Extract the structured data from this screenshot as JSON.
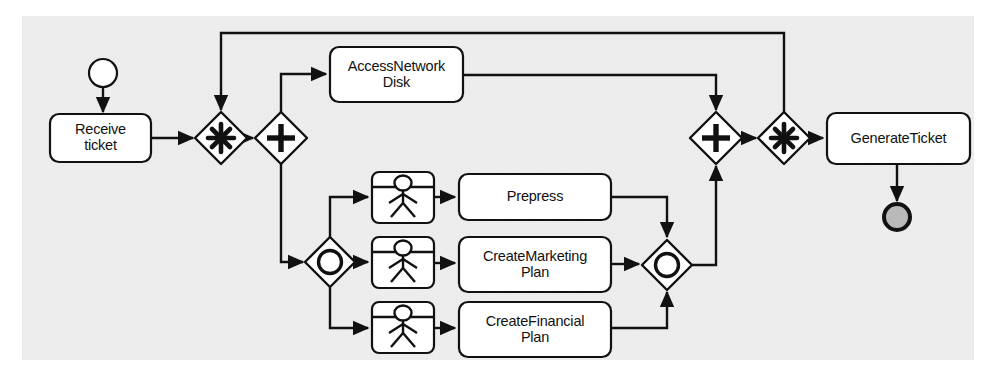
{
  "diagram": {
    "type": "bpmn-process-diagram",
    "background_color": "#e9e9e9",
    "stroke_color": "#111111",
    "fill_color": "#ffffff",
    "end_event_fill": "#b9b9b9"
  },
  "events": [
    {
      "id": "start",
      "kind": "start-event",
      "shape": "circle",
      "label": "",
      "cx": 103,
      "cy": 73,
      "r": 14,
      "fill": "#ffffff",
      "stroke_width": 2
    },
    {
      "id": "end",
      "kind": "end-event",
      "shape": "circle",
      "label": "",
      "cx": 897,
      "cy": 217,
      "r": 14,
      "fill": "#b9b9b9",
      "stroke_width": 4
    }
  ],
  "tasks": [
    {
      "id": "receive_ticket",
      "label": "Receive\nticket",
      "kind": "task",
      "x": 50,
      "y": 114,
      "w": 101,
      "h": 48
    },
    {
      "id": "access_network_disk",
      "label": "AccessNetwork\nDisk",
      "kind": "task",
      "x": 330,
      "y": 47,
      "w": 133,
      "h": 55
    },
    {
      "id": "prepress",
      "label": "Prepress",
      "kind": "task",
      "x": 459,
      "y": 174,
      "w": 152,
      "h": 46
    },
    {
      "id": "create_marketing_plan",
      "label": "CreateMarketing\nPlan",
      "kind": "task",
      "x": 459,
      "y": 237,
      "w": 152,
      "h": 55
    },
    {
      "id": "create_financial_plan",
      "label": "CreateFinancial\nPlan",
      "kind": "task",
      "x": 459,
      "y": 302,
      "w": 152,
      "h": 55
    },
    {
      "id": "user_task_prepress",
      "label": "",
      "kind": "user-task-icon",
      "x": 372,
      "y": 172,
      "w": 62,
      "h": 51
    },
    {
      "id": "user_task_marketing",
      "label": "",
      "kind": "user-task-icon",
      "x": 372,
      "y": 237,
      "w": 62,
      "h": 51
    },
    {
      "id": "user_task_financial",
      "label": "",
      "kind": "user-task-icon",
      "x": 372,
      "y": 302,
      "w": 62,
      "h": 51
    }
  ],
  "gateways": [
    {
      "id": "complex_split",
      "kind": "complex-gateway",
      "marker": "asterisk",
      "cx": 221,
      "cy": 138,
      "r": 26
    },
    {
      "id": "parallel_split",
      "kind": "parallel-gateway",
      "marker": "plus",
      "cx": 281,
      "cy": 138,
      "r": 26
    },
    {
      "id": "inclusive_split",
      "kind": "inclusive-gateway",
      "marker": "circle",
      "cx": 330,
      "cy": 262,
      "r": 25
    },
    {
      "id": "inclusive_join",
      "kind": "inclusive-gateway",
      "marker": "circle",
      "cx": 667,
      "cy": 265,
      "r": 25
    },
    {
      "id": "parallel_join",
      "kind": "parallel-gateway",
      "marker": "plus",
      "cx": 716,
      "cy": 138,
      "r": 26
    },
    {
      "id": "complex_join",
      "kind": "complex-gateway",
      "marker": "asterisk",
      "cx": 784,
      "cy": 138,
      "r": 26
    }
  ],
  "flows": [
    {
      "id": "f_start_receive",
      "from": "start",
      "to": "receive_ticket"
    },
    {
      "id": "f_receive_complex",
      "from": "receive_ticket",
      "to": "complex_split"
    },
    {
      "id": "f_complex_parallel",
      "from": "complex_split",
      "to": "parallel_split"
    },
    {
      "id": "f_parallel_access",
      "from": "parallel_split",
      "to": "access_network_disk"
    },
    {
      "id": "f_parallel_inclusive",
      "from": "parallel_split",
      "to": "inclusive_split"
    },
    {
      "id": "f_access_paralleljoin",
      "from": "access_network_disk",
      "to": "parallel_join"
    },
    {
      "id": "f_inc_usr_prepress",
      "from": "inclusive_split",
      "to": "user_task_prepress"
    },
    {
      "id": "f_inc_usr_marketing",
      "from": "inclusive_split",
      "to": "user_task_marketing"
    },
    {
      "id": "f_inc_usr_financial",
      "from": "inclusive_split",
      "to": "user_task_financial"
    },
    {
      "id": "f_usr_prepress",
      "from": "user_task_prepress",
      "to": "prepress"
    },
    {
      "id": "f_usr_marketing",
      "from": "user_task_marketing",
      "to": "create_marketing_plan"
    },
    {
      "id": "f_usr_financial",
      "from": "user_task_financial",
      "to": "create_financial_plan"
    },
    {
      "id": "f_prepress_incjoin",
      "from": "prepress",
      "to": "inclusive_join"
    },
    {
      "id": "f_marketing_incjoin",
      "from": "create_marketing_plan",
      "to": "inclusive_join"
    },
    {
      "id": "f_financial_incjoin",
      "from": "create_financial_plan",
      "to": "inclusive_join"
    },
    {
      "id": "f_incjoin_paralleljoin",
      "from": "inclusive_join",
      "to": "parallel_join"
    },
    {
      "id": "f_paralleljoin_complex",
      "from": "parallel_join",
      "to": "complex_join"
    },
    {
      "id": "f_complexjoin_generate",
      "from": "complex_join",
      "to": "generate_ticket"
    },
    {
      "id": "f_loopback",
      "from": "complex_join",
      "to": "complex_split"
    },
    {
      "id": "f_generate_end",
      "from": "generate_ticket",
      "to": "end"
    }
  ],
  "generate_task": {
    "id": "generate_ticket",
    "label": "GenerateTicket",
    "kind": "task",
    "x": 827,
    "y": 113,
    "w": 143,
    "h": 51
  }
}
